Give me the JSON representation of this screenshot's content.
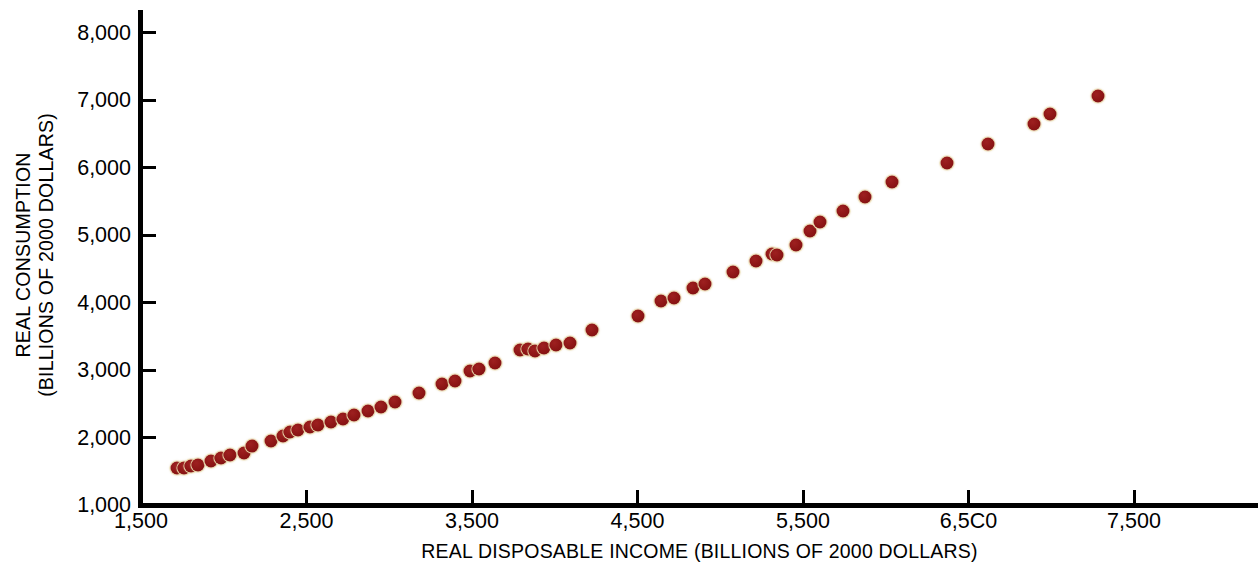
{
  "chart_data": {
    "type": "scatter",
    "title": "",
    "xlabel": "REAL DISPOSABLE INCOME (BILLIONS OF 2000 DOLLARS)",
    "ylabel": "REAL CONSUMPTION (BILLIONS OF 2000 DOLLARS)",
    "ylabel_line1": "REAL CONSUMPTION",
    "ylabel_line2": "(BILLIONS OF 2000 DOLLARS)",
    "xlim": [
      1000,
      7900
    ],
    "ylim": [
      1000,
      8150
    ],
    "xticks": [
      1500,
      2500,
      3500,
      4500,
      5500,
      6500,
      7500
    ],
    "xtick_labels": [
      "1,500",
      "2,500",
      "3,500",
      "4,500",
      "5,500",
      "6,5C0",
      "7,500"
    ],
    "yticks": [
      1000,
      2000,
      3000,
      4000,
      5000,
      6000,
      7000,
      8000
    ],
    "ytick_labels": [
      "1,000",
      "2,000",
      "3,000",
      "4,000",
      "5,000",
      "6,000",
      "7,000",
      "8,000"
    ],
    "grid": false,
    "legend": false,
    "marker_color": "#8C1515",
    "marker_edge_color": "#E4D4A4",
    "marker_size": 13,
    "series": [
      {
        "name": "Real consumption vs real disposable income",
        "points": [
          [
            1720,
            1550
          ],
          [
            1760,
            1555
          ],
          [
            1800,
            1580
          ],
          [
            1845,
            1600
          ],
          [
            1920,
            1655
          ],
          [
            1985,
            1700
          ],
          [
            2035,
            1745
          ],
          [
            2125,
            1765
          ],
          [
            2170,
            1870
          ],
          [
            2285,
            1945
          ],
          [
            2355,
            2020
          ],
          [
            2400,
            2080
          ],
          [
            2450,
            2110
          ],
          [
            2520,
            2150
          ],
          [
            2570,
            2185
          ],
          [
            2650,
            2230
          ],
          [
            2720,
            2275
          ],
          [
            2790,
            2340
          ],
          [
            2870,
            2395
          ],
          [
            2950,
            2450
          ],
          [
            3035,
            2525
          ],
          [
            3180,
            2665
          ],
          [
            3320,
            2790
          ],
          [
            3395,
            2840
          ],
          [
            3490,
            2985
          ],
          [
            3545,
            3020
          ],
          [
            3640,
            3105
          ],
          [
            3790,
            3290
          ],
          [
            3840,
            3310
          ],
          [
            3880,
            3275
          ],
          [
            3935,
            3320
          ],
          [
            4005,
            3370
          ],
          [
            4090,
            3400
          ],
          [
            4225,
            3595
          ],
          [
            4500,
            3800
          ],
          [
            4640,
            4020
          ],
          [
            4720,
            4070
          ],
          [
            4835,
            4220
          ],
          [
            4905,
            4275
          ],
          [
            5075,
            4455
          ],
          [
            5215,
            4615
          ],
          [
            5315,
            4720
          ],
          [
            5345,
            4710
          ],
          [
            5455,
            4855
          ],
          [
            5545,
            5055
          ],
          [
            5600,
            5200
          ],
          [
            5740,
            5360
          ],
          [
            5875,
            5570
          ],
          [
            6035,
            5780
          ],
          [
            6370,
            6070
          ],
          [
            6620,
            6350
          ],
          [
            6895,
            6650
          ],
          [
            6995,
            6800
          ],
          [
            7285,
            7060
          ]
        ]
      }
    ]
  },
  "axes": {
    "y_axis_name": "y-axis",
    "x_axis_name": "x-axis"
  }
}
